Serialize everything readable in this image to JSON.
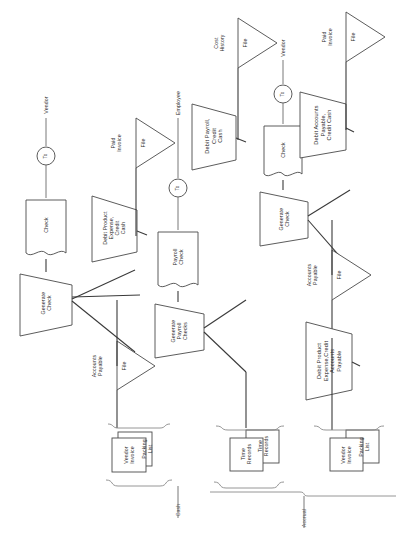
{
  "diagram": {
    "orientation": "rotated-90-ccw",
    "background_color": "#ffffff",
    "line_color": "#3a3a3a",
    "shape_fill": "#ffffff",
    "shape_stroke": "#4a4a4a"
  },
  "groups": [
    {
      "id": "cash",
      "label": "Cash"
    },
    {
      "id": "accrual",
      "label": "Accrual"
    }
  ],
  "nodes": {
    "cash_branch": {
      "terminator_vendor": "Vendor",
      "connector_to_1": "To",
      "document_check": "Check",
      "process_generate_check": "Generate\nCheck",
      "journal_entry": "Debit Product\nExpense,\nCredit\nCash",
      "file_paid_invoice_label": "Paid\nInvoice",
      "file_paid_invoice_symbol": "File",
      "file_accounts_payable_label": "Accounts\nPayable",
      "file_accounts_payable_symbol": "File",
      "source_docs": [
        "Vendor\nInvoice",
        "Packing\nList"
      ]
    },
    "payroll_branch": {
      "terminator_employee": "Employee",
      "connector_to_2": "To",
      "document_payroll_check": "Payroll\nCheck",
      "process_generate_payroll_checks": "Generate\nPayroll\nChecks",
      "journal_entry": "Debit Payroll,\nCredit\nCash",
      "file_cost_history_label": "Cost\nHistory",
      "file_cost_history_symbol": "File",
      "source_docs": [
        "Time\nRecords",
        "Time\nRecords"
      ]
    },
    "accrual_branch": {
      "terminator_vendor": "Vendor",
      "connector_to_3": "To",
      "document_check": "Check",
      "process_generate_check": "Generate\nCheck",
      "journal_entry_disbursement": "Debit Accounts\nPayable,\nCredit Cash",
      "journal_entry_accrual": "Debit Product\nExpense,Credit\nAccounts\nPayable",
      "file_paid_invoice_label": "Paid\nInvoice",
      "file_paid_invoice_symbol": "File",
      "file_accounts_payable_label": "Accounts\nPayable",
      "file_accounts_payable_symbol": "File",
      "source_docs": [
        "Vendor\nInvoice",
        "Packing\nList"
      ]
    }
  }
}
